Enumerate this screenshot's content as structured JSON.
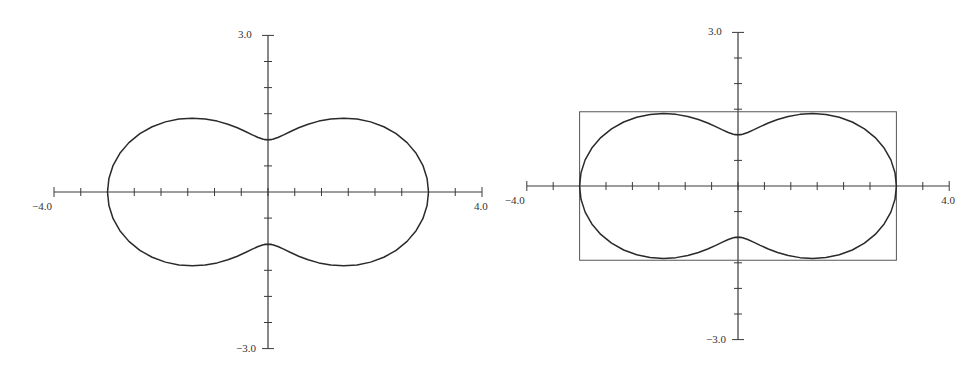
{
  "chart_data": [
    {
      "type": "line",
      "subtype": "polar-parametric",
      "title": "",
      "equation": "r = 2 + cos(2θ)",
      "xlabel": "",
      "ylabel": "",
      "xlim": [
        -4.0,
        4.0
      ],
      "ylim": [
        -3.0,
        3.0
      ],
      "x_tick_labels": [
        "-4.0",
        "4.0"
      ],
      "y_tick_labels": [
        "3.0",
        "-3.0"
      ],
      "tick_step": 0.5,
      "grid": false,
      "bounding_box": null,
      "key_points": [
        {
          "x": 3.0,
          "y": 0.0
        },
        {
          "x": -3.0,
          "y": 0.0
        },
        {
          "x": 0.0,
          "y": 1.0
        },
        {
          "x": 0.0,
          "y": -1.0
        },
        {
          "x": 1.5,
          "y": 1.45
        },
        {
          "x": -1.5,
          "y": 1.45
        },
        {
          "x": 1.5,
          "y": -1.45
        },
        {
          "x": -1.5,
          "y": -1.45
        }
      ]
    },
    {
      "type": "line",
      "subtype": "polar-parametric",
      "title": "",
      "equation": "r = 2 + cos(2θ)",
      "xlabel": "",
      "ylabel": "",
      "xlim": [
        -4.0,
        4.0
      ],
      "ylim": [
        -3.0,
        3.0
      ],
      "x_tick_labels": [
        "-4.0",
        "4.0"
      ],
      "y_tick_labels": [
        "3.0",
        "-3.0"
      ],
      "tick_step": 0.5,
      "grid": false,
      "bounding_box": {
        "xmin": -3.0,
        "xmax": 3.0,
        "ymin": -1.45,
        "ymax": 1.45
      },
      "key_points": [
        {
          "x": 3.0,
          "y": 0.0
        },
        {
          "x": -3.0,
          "y": 0.0
        },
        {
          "x": 0.0,
          "y": 1.0
        },
        {
          "x": 0.0,
          "y": -1.0
        },
        {
          "x": 1.5,
          "y": 1.45
        },
        {
          "x": -1.5,
          "y": 1.45
        },
        {
          "x": 1.5,
          "y": -1.45
        },
        {
          "x": -1.5,
          "y": -1.45
        }
      ]
    }
  ],
  "plots": [
    {
      "labels": {
        "xmin": "−4.0",
        "xmax": "4.0",
        "ymax": "3.0",
        "ymin": "−3.0"
      },
      "layout": {
        "cx": 268,
        "cy": 192,
        "sx": 53.5,
        "sy": 52.2,
        "xmin": -4,
        "xmax": 4,
        "ymin": -3,
        "ymax": 3
      },
      "box": false
    },
    {
      "labels": {
        "xmin": "−4.0",
        "xmax": "4.0",
        "ymax": "3.0",
        "ymin": "−3.0"
      },
      "layout": {
        "cx": 738,
        "cy": 186,
        "sx": 52.8,
        "sy": 51.2,
        "xmin": -4,
        "xmax": 4,
        "ymin": -3,
        "ymax": 3
      },
      "box": true
    }
  ],
  "colors": {
    "ink": "#2a2a2a",
    "axis": "#3a3a3a",
    "box": "#555555",
    "label": "#333333"
  }
}
